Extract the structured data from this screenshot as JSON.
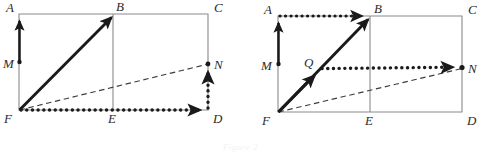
{
  "figure": {
    "caption": "Figure 2",
    "colors": {
      "rect_stroke": "#8a8a8a",
      "thick_stroke": "#1a1a1a",
      "dotted_stroke": "#1a1a1a",
      "dashed_stroke": "#3c3c3c",
      "label_fill": "#2b2b2b",
      "background": "#ffffff"
    },
    "panels": [
      {
        "id": "left-panel",
        "name": "left-figure",
        "rectangle": {
          "A": [
            19,
            14
          ],
          "C": [
            208,
            14
          ],
          "D": [
            208,
            110
          ],
          "F": [
            19,
            110
          ]
        },
        "midline": {
          "B": [
            113,
            14
          ],
          "E": [
            113,
            110
          ]
        },
        "points": {
          "M": [
            19,
            62
          ],
          "N": [
            208,
            64
          ]
        },
        "labels": [
          {
            "text": "A",
            "x": 6,
            "y": 12,
            "name": "vertex-label-a"
          },
          {
            "text": "B",
            "x": 116,
            "y": 11,
            "name": "vertex-label-b"
          },
          {
            "text": "C",
            "x": 214,
            "y": 12,
            "name": "vertex-label-c"
          },
          {
            "text": "M",
            "x": 3,
            "y": 68,
            "name": "vertex-label-m"
          },
          {
            "text": "N",
            "x": 214,
            "y": 69,
            "name": "vertex-label-n"
          },
          {
            "text": "F",
            "x": 4,
            "y": 123,
            "name": "vertex-label-f"
          },
          {
            "text": "E",
            "x": 108,
            "y": 123,
            "name": "vertex-label-e"
          },
          {
            "text": "D",
            "x": 213,
            "y": 123,
            "name": "vertex-label-d"
          }
        ],
        "vectors": [
          {
            "name": "vector-m-to-a",
            "from": "M",
            "to": "A",
            "style": "thick-solid"
          },
          {
            "name": "vector-f-to-b",
            "from": "F",
            "to": "B",
            "style": "thick-solid"
          },
          {
            "name": "vector-f-to-d",
            "from": "F",
            "to": "D",
            "style": "thick-dotted"
          },
          {
            "name": "vector-d-to-n",
            "from": "D",
            "to": "N",
            "style": "thick-dotted"
          },
          {
            "name": "vector-f-to-n",
            "from": "F",
            "to": "N",
            "style": "dashed"
          }
        ]
      },
      {
        "id": "right-panel",
        "name": "right-figure",
        "rectangle": {
          "A": [
            278,
            16
          ],
          "C": [
            462,
            16
          ],
          "D": [
            462,
            112
          ],
          "F": [
            278,
            112
          ]
        },
        "midline": {
          "B": [
            370,
            16
          ],
          "E": [
            370,
            112
          ]
        },
        "points": {
          "M": [
            278,
            64
          ],
          "N": [
            462,
            68
          ],
          "Q": [
            318,
            72
          ]
        },
        "labels": [
          {
            "text": "A",
            "x": 264,
            "y": 14,
            "name": "vertex-label-a"
          },
          {
            "text": "B",
            "x": 374,
            "y": 13,
            "name": "vertex-label-b"
          },
          {
            "text": "C",
            "x": 468,
            "y": 14,
            "name": "vertex-label-c"
          },
          {
            "text": "M",
            "x": 261,
            "y": 70,
            "name": "vertex-label-m"
          },
          {
            "text": "Q",
            "x": 304,
            "y": 67,
            "name": "vertex-label-q"
          },
          {
            "text": "N",
            "x": 468,
            "y": 73,
            "name": "vertex-label-n"
          },
          {
            "text": "F",
            "x": 262,
            "y": 125,
            "name": "vertex-label-f"
          },
          {
            "text": "E",
            "x": 365,
            "y": 125,
            "name": "vertex-label-e"
          },
          {
            "text": "D",
            "x": 467,
            "y": 125,
            "name": "vertex-label-d"
          }
        ],
        "vectors": [
          {
            "name": "vector-m-to-a",
            "from": "M",
            "to": "A",
            "style": "thick-solid"
          },
          {
            "name": "vector-a-to-b",
            "from": "A",
            "to": "B",
            "style": "thick-dotted"
          },
          {
            "name": "vector-f-to-b",
            "from": "F",
            "to": "B",
            "style": "thick-solid"
          },
          {
            "name": "vector-f-to-q",
            "from": "F",
            "to": "Q",
            "style": "thick-solid"
          },
          {
            "name": "vector-q-to-n",
            "from": "Q",
            "to": "N",
            "style": "thick-dotted"
          },
          {
            "name": "vector-f-to-n",
            "from": "F",
            "to": "N",
            "style": "dashed"
          }
        ]
      }
    ]
  }
}
